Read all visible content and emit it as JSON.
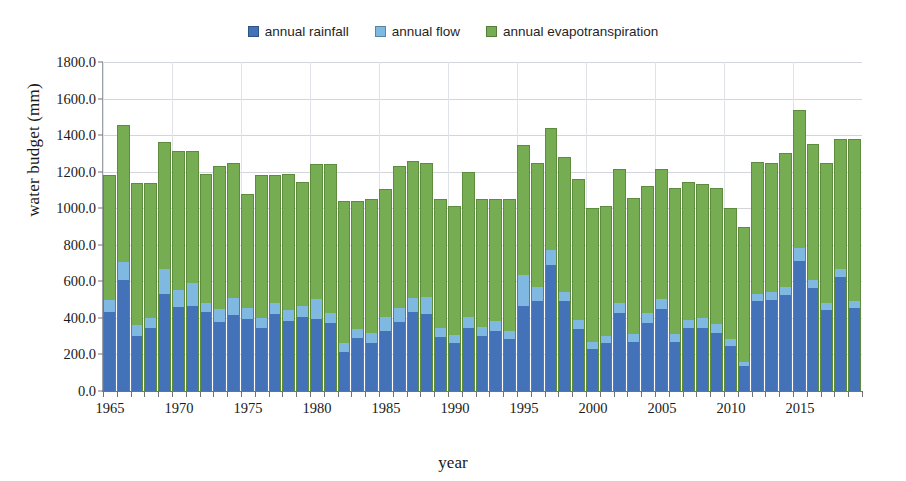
{
  "legend": {
    "items": [
      {
        "label": "annual rainfall",
        "color": "#4472b8",
        "name": "legend-item-annual-rainfall"
      },
      {
        "label": "annual flow",
        "color": "#7fb8e0",
        "name": "legend-item-annual-flow"
      },
      {
        "label": "annual evapotranspiration",
        "color": "#76ad52",
        "name": "legend-item-annual-evapotranspiration"
      }
    ]
  },
  "axes": {
    "ylabel": "water budget (mm)",
    "xlabel": "year",
    "yticks": [
      "0.0",
      "200.0",
      "400.0",
      "600.0",
      "800.0",
      "1000.0",
      "1200.0",
      "1400.0",
      "1600.0",
      "1800.0"
    ],
    "xticks": [
      "1965",
      "1970",
      "1975",
      "1980",
      "1985",
      "1990",
      "1995",
      "2000",
      "2005",
      "2010",
      "2015"
    ]
  },
  "chart_data": {
    "type": "bar",
    "title": "",
    "xlabel": "year",
    "ylabel": "water budget (mm)",
    "ylim": [
      0,
      1800
    ],
    "ytick_step": 200,
    "grid": true,
    "stacked": true,
    "legend_position": "top-center",
    "colors": {
      "annual rainfall": "#4472b8",
      "annual flow": "#7fb8e0",
      "annual evapotranspiration": "#76ad52"
    },
    "categories": [
      1965,
      1966,
      1967,
      1968,
      1969,
      1970,
      1971,
      1972,
      1973,
      1974,
      1975,
      1976,
      1977,
      1978,
      1979,
      1980,
      1981,
      1982,
      1983,
      1984,
      1985,
      1986,
      1987,
      1988,
      1989,
      1990,
      1991,
      1992,
      1993,
      1994,
      1995,
      1996,
      1997,
      1998,
      1999,
      2000,
      2001,
      2002,
      2003,
      2004,
      2005,
      2006,
      2007,
      2008,
      2009,
      2010,
      2011,
      2012,
      2013,
      2014,
      2015,
      2016,
      2017,
      2018,
      2019
    ],
    "series": [
      {
        "name": "annual rainfall",
        "values": [
          430,
          610,
          300,
          345,
          530,
          460,
          465,
          430,
          375,
          415,
          395,
          345,
          420,
          385,
          405,
          395,
          370,
          215,
          290,
          265,
          330,
          375,
          430,
          420,
          295,
          260,
          345,
          300,
          330,
          285,
          465,
          490,
          690,
          495,
          340,
          230,
          260,
          425,
          270,
          370,
          450,
          270,
          345,
          345,
          320,
          245,
          135,
          495,
          500,
          525,
          710,
          565,
          445,
          625,
          455
        ]
      },
      {
        "name": "annual flow",
        "values": [
          70,
          95,
          60,
          55,
          135,
          95,
          125,
          50,
          75,
          95,
          60,
          55,
          60,
          60,
          60,
          110,
          55,
          45,
          50,
          55,
          75,
          80,
          80,
          95,
          50,
          45,
          60,
          50,
          55,
          45,
          170,
          80,
          80,
          45,
          50,
          40,
          40,
          55,
          40,
          55,
          55,
          40,
          45,
          55,
          45,
          40,
          25,
          35,
          40,
          45,
          70,
          40,
          35,
          40,
          35
        ]
      },
      {
        "name": "annual evapotranspiration",
        "values": [
          680,
          750,
          780,
          740,
          700,
          760,
          725,
          705,
          780,
          740,
          625,
          780,
          700,
          745,
          680,
          735,
          815,
          780,
          700,
          730,
          700,
          775,
          750,
          730,
          705,
          705,
          795,
          700,
          665,
          720,
          710,
          680,
          670,
          740,
          770,
          730,
          710,
          735,
          745,
          695,
          710,
          800,
          755,
          735,
          745,
          715,
          740,
          725,
          710,
          730,
          760,
          745,
          765,
          715,
          890
        ]
      }
    ]
  }
}
